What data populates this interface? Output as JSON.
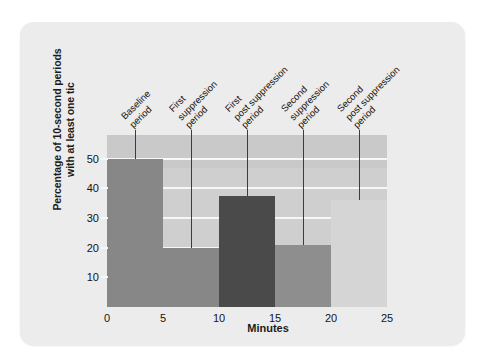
{
  "figure": {
    "panel_background": "#ececed",
    "plot_background": "#cfcfcf",
    "gridline_color": "#f7f7f7"
  },
  "chart_data": {
    "type": "bar",
    "title": "",
    "subtitle": "",
    "xlabel": "Minutes",
    "ylabel": "Percentage of 10-second periods\nwith at least one tic",
    "ylabel_lines": [
      "Percentage of 10-second periods",
      "with at least one tic"
    ],
    "xlim": [
      0,
      25
    ],
    "ylim": [
      0,
      58
    ],
    "grid": true,
    "legend": "none",
    "x_tick_labels": [
      "0",
      "5",
      "10",
      "15",
      "20",
      "25"
    ],
    "x_ticks": [
      0,
      5,
      10,
      15,
      20,
      25
    ],
    "y_tick_labels": [
      "10",
      "20",
      "30",
      "40",
      "50"
    ],
    "y_ticks": [
      10,
      20,
      30,
      40,
      50
    ],
    "categories": [
      "Baseline period",
      "First suppression period",
      "First post suppression period",
      "Second suppression period",
      "Second post suppression period"
    ],
    "values": [
      50,
      20,
      37.5,
      21,
      36
    ],
    "x_ranges": [
      [
        0,
        5
      ],
      [
        5,
        10
      ],
      [
        10,
        15
      ],
      [
        15,
        20
      ],
      [
        20,
        25
      ]
    ],
    "bar_colors": [
      "#878787",
      "#878787",
      "#4a4a4a",
      "#8e8e8e",
      "#d5d5d5"
    ],
    "annotations": [
      {
        "label": "Baseline period",
        "lines": [
          "Baseline",
          "period"
        ],
        "x": 2.5,
        "value": 50
      },
      {
        "label": "First suppression period",
        "lines": [
          "First",
          "suppression",
          "period"
        ],
        "x": 7.5,
        "value": 20
      },
      {
        "label": "First post suppression period",
        "lines": [
          "First",
          "post suppression",
          "period"
        ],
        "x": 12.5,
        "value": 37.5
      },
      {
        "label": "Second suppression period",
        "lines": [
          "Second",
          "suppression",
          "period"
        ],
        "x": 17.5,
        "value": 21
      },
      {
        "label": "Second post suppression period",
        "lines": [
          "Second",
          "post suppression",
          "period"
        ],
        "x": 22.5,
        "value": 36
      }
    ]
  }
}
